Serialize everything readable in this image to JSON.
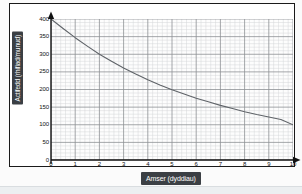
{
  "chart_data": {
    "type": "line",
    "title": "",
    "xlabel": "Amser (dyddiau)",
    "ylabel": "Actifedd (rhifiad/munud)",
    "xlim": [
      0,
      10
    ],
    "ylim": [
      0,
      400
    ],
    "xticks": [
      "0",
      "1",
      "2",
      "3",
      "4",
      "5",
      "6",
      "7",
      "8",
      "9",
      "10"
    ],
    "yticks": [
      "0",
      "50",
      "100",
      "150",
      "200",
      "250",
      "300",
      "350",
      "400"
    ],
    "grid": true,
    "minor_grid": true,
    "legend": "none",
    "series": [
      {
        "name": "Actifedd",
        "x": [
          0,
          0.5,
          1,
          1.5,
          2,
          2.5,
          3,
          3.5,
          4,
          4.5,
          5,
          5.5,
          6,
          6.5,
          7,
          7.5,
          8,
          8.5,
          9,
          9.5,
          10
        ],
        "values": [
          400,
          373,
          347,
          323,
          300,
          280,
          261,
          244,
          228,
          213,
          199,
          187,
          175,
          165,
          155,
          146,
          137,
          129,
          122,
          115,
          100
        ]
      }
    ],
    "annotations": {
      "x_axis_arrow": true,
      "y_axis_arrow": true,
      "curve_color": "#5f6368",
      "axis_color": "#111111",
      "major_grid_color": "#8d9194",
      "minor_grid_color": "#d4d7d9",
      "label_plate_color": "#3b3f44",
      "label_text_color": "#ffffff"
    }
  }
}
